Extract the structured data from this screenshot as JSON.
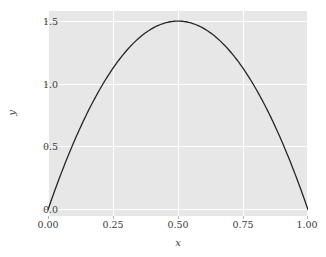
{
  "chart_data": {
    "type": "line",
    "title": "",
    "xlabel": "x",
    "ylabel": "y",
    "xlim": [
      0.0,
      1.0
    ],
    "ylim": [
      -0.05,
      1.58
    ],
    "grid": true,
    "legend": null,
    "x_ticks": [
      0.0,
      0.25,
      0.5,
      0.75,
      1.0
    ],
    "x_ticklabels": [
      "0.00",
      "0.25",
      "0.50",
      "0.75",
      "1.00"
    ],
    "y_ticks": [
      0.0,
      0.5,
      1.0,
      1.5
    ],
    "y_ticklabels": [
      "0.0",
      "0.5",
      "1.0",
      "1.5"
    ],
    "series": [
      {
        "name": "curve",
        "color": "#262626",
        "linewidth": 1.3,
        "formula": "y = 6x(1 - x)",
        "x": [
          0.0,
          0.05,
          0.1,
          0.15,
          0.2,
          0.25,
          0.3,
          0.35,
          0.4,
          0.45,
          0.5,
          0.55,
          0.6,
          0.65,
          0.7,
          0.75,
          0.8,
          0.85,
          0.9,
          0.95,
          1.0
        ],
        "values": [
          0.0,
          0.285,
          0.54,
          0.765,
          0.96,
          1.125,
          1.26,
          1.365,
          1.44,
          1.485,
          1.5,
          1.485,
          1.44,
          1.365,
          1.26,
          1.125,
          0.96,
          0.765,
          0.54,
          0.285,
          0.0
        ]
      }
    ],
    "style": {
      "panel_background": "#e7e7e7",
      "gridline_color": "#ffffff",
      "figure_background": "#ffffff",
      "tick_color": "#b8b8b8",
      "text_color": "#3b3b3b"
    }
  }
}
